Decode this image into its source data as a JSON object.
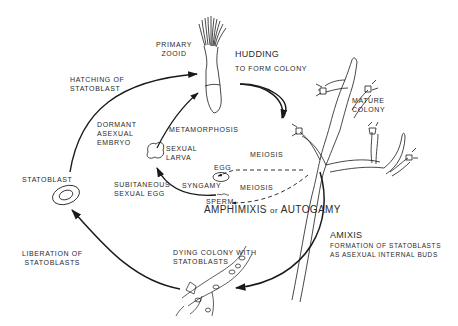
{
  "diagram": {
    "type": "life-cycle",
    "colors": {
      "ink": "#1a1a1a",
      "text": "#2a2a2a",
      "background": "#ffffff"
    },
    "nodes": {
      "primary_zooid": {
        "lines": [
          "PRIMARY",
          "ZOOID"
        ]
      },
      "budding": {
        "title": "HUDDING",
        "subtitle": "TO  FORM  COLONY"
      },
      "mature_colony": {
        "lines": [
          "MATURE",
          "COLONY"
        ]
      },
      "hatching": {
        "lines": [
          "HATCHING   OF",
          "STATOBLAST"
        ]
      },
      "dormant": {
        "lines": [
          "DORMANT",
          "ASEXUAL",
          "EMBRYO"
        ]
      },
      "metamorphosis": {
        "label": "METAMORPHOSIS"
      },
      "sexual_larva": {
        "lines": [
          "SEXUAL",
          "LARVA"
        ]
      },
      "egg": {
        "label": "EGG"
      },
      "meiosis_upper": {
        "label": "MEIOSIS"
      },
      "meiosis_lower": {
        "label": "MEIOSIS"
      },
      "syngamy": {
        "label": "SYNGAMY"
      },
      "sperm": {
        "label": "SPERM"
      },
      "subitaneous": {
        "lines": [
          "SUBITANEOUS",
          "SEXUAL  EGG"
        ]
      },
      "amphimixis": {
        "part1": "AMPHIMIXIS",
        "part2": "or",
        "part3": "AUTOGAMY"
      },
      "statoblast": {
        "label": "STATOBLAST"
      },
      "liberation": {
        "lines": [
          "LIBERATION   OF",
          "STATOBLASTS"
        ]
      },
      "dying_colony": {
        "lines": [
          "DYING  COLONY  WITH",
          "STATOBLASTS"
        ]
      },
      "amixis": {
        "title": "AMIXIS",
        "lines": [
          "FORMATION   OF  STATOBLASTS",
          "AS  ASEXUAL  INTERNAL  BUDS"
        ]
      }
    }
  }
}
